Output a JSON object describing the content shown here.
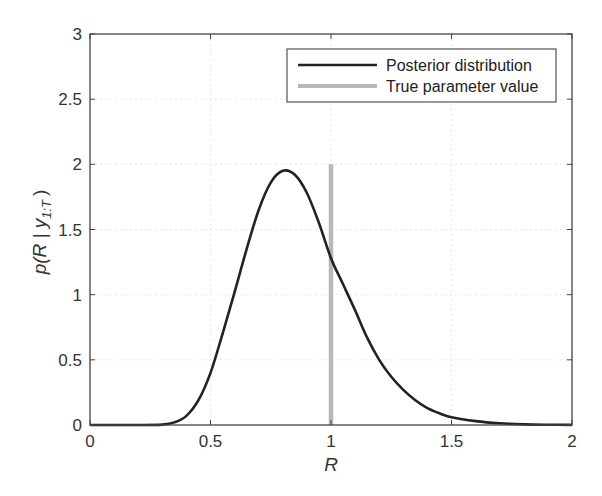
{
  "chart_data": {
    "type": "line",
    "title": "",
    "xlabel": "R",
    "ylabel": "p(R | y_{1:T})",
    "xlim": [
      0,
      2
    ],
    "ylim": [
      0,
      3
    ],
    "x_ticks": [
      "0",
      "0.5",
      "1",
      "1.5",
      "2"
    ],
    "y_ticks": [
      "0",
      "0.5",
      "1",
      "1.5",
      "2",
      "2.5",
      "3"
    ],
    "grid": true,
    "legend_position": "upper right",
    "series": [
      {
        "name": "Posterior distribution",
        "color": "#222222",
        "x": [
          0,
          0.1,
          0.2,
          0.3,
          0.35,
          0.4,
          0.45,
          0.5,
          0.55,
          0.6,
          0.65,
          0.7,
          0.75,
          0.8,
          0.85,
          0.9,
          0.95,
          1.0,
          1.05,
          1.1,
          1.15,
          1.2,
          1.25,
          1.3,
          1.35,
          1.4,
          1.45,
          1.5,
          1.6,
          1.7,
          1.8,
          1.9,
          2.0
        ],
        "values": [
          0,
          0,
          0,
          0.003,
          0.02,
          0.07,
          0.19,
          0.4,
          0.7,
          1.02,
          1.35,
          1.65,
          1.86,
          1.95,
          1.92,
          1.78,
          1.55,
          1.28,
          1.08,
          0.88,
          0.67,
          0.5,
          0.37,
          0.27,
          0.19,
          0.13,
          0.09,
          0.06,
          0.03,
          0.013,
          0.005,
          0.002,
          0.001
        ]
      },
      {
        "name": "True parameter value",
        "color": "#b8b8b8",
        "x": [
          1,
          1
        ],
        "values": [
          0,
          2
        ]
      }
    ]
  },
  "legend": {
    "items": [
      {
        "label": "Posterior distribution"
      },
      {
        "label": "True parameter value"
      }
    ]
  },
  "axes": {
    "xlabel": "R",
    "ylabel_main": "p(R | y",
    "ylabel_sub": "1:T",
    "ylabel_end": ")"
  }
}
